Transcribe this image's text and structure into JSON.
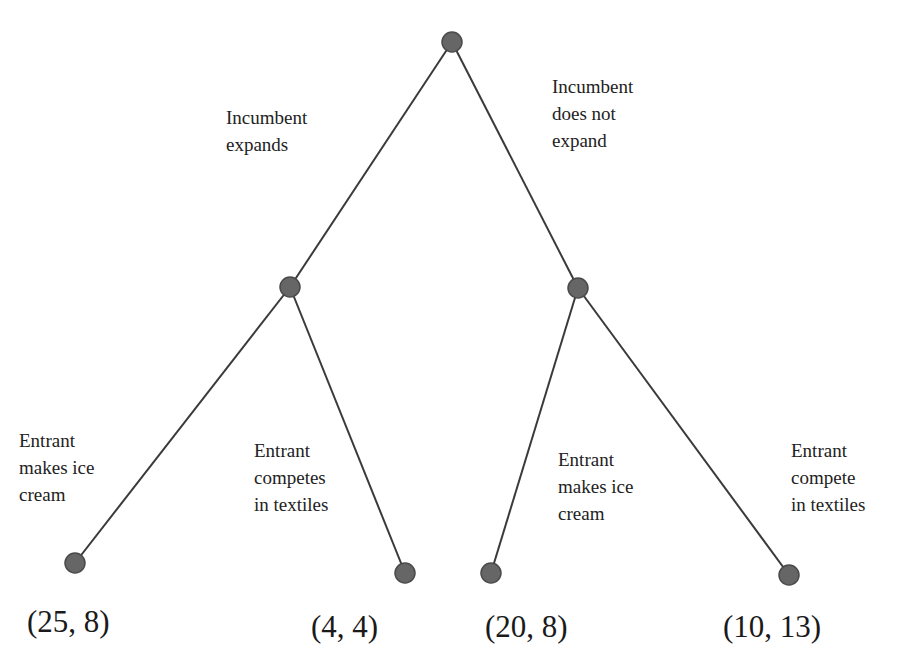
{
  "diagram": {
    "type": "game-tree",
    "nodes": [
      {
        "id": "root",
        "x": 452,
        "y": 42
      },
      {
        "id": "n_expand",
        "x": 290,
        "y": 287
      },
      {
        "id": "n_noexpand",
        "x": 578,
        "y": 288
      },
      {
        "id": "leaf1",
        "x": 75,
        "y": 563
      },
      {
        "id": "leaf2",
        "x": 405,
        "y": 573
      },
      {
        "id": "leaf3",
        "x": 491,
        "y": 573
      },
      {
        "id": "leaf4",
        "x": 789,
        "y": 575
      }
    ],
    "edges": [
      {
        "from": "root",
        "to": "n_expand"
      },
      {
        "from": "root",
        "to": "n_noexpand"
      },
      {
        "from": "n_expand",
        "to": "leaf1"
      },
      {
        "from": "n_expand",
        "to": "leaf2"
      },
      {
        "from": "n_noexpand",
        "to": "leaf3"
      },
      {
        "from": "n_noexpand",
        "to": "leaf4"
      }
    ],
    "labels": {
      "incumbent_expands": "Incumbent\nexpands",
      "incumbent_not_expand": "Incumbent\ndoes not\nexpand",
      "left_ice_cream": "Entrant\nmakes ice\ncream",
      "left_textiles": "Entrant\ncompetes\nin textiles",
      "right_ice_cream": "Entrant\nmakes ice\ncream",
      "right_textiles": "Entrant\ncompete\nin textiles"
    },
    "payoffs": [
      "(25, 8)",
      "(4, 4)",
      "(20, 8)",
      "(10, 13)"
    ],
    "colors": {
      "node": "#666666",
      "node_edge": "#4a4a4a",
      "line": "#3a3a3a"
    }
  }
}
